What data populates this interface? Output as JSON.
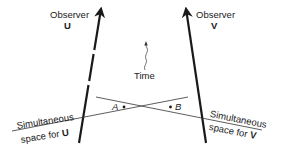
{
  "observer_u": {
    "title": "Observer",
    "name": "U"
  },
  "observer_v": {
    "title": "Observer",
    "name": "V"
  },
  "time_label": "Time",
  "events": {
    "a": "A",
    "b": "B"
  },
  "simultaneous_u": {
    "line1": "Simultaneous",
    "line2_prefix": "space for ",
    "line2_name": "U"
  },
  "simultaneous_v": {
    "line1": "Simultaneous",
    "line2_prefix": "space for ",
    "line2_name": "V"
  },
  "colors": {
    "ink": "#1a1a1a",
    "background": "#ffffff"
  }
}
